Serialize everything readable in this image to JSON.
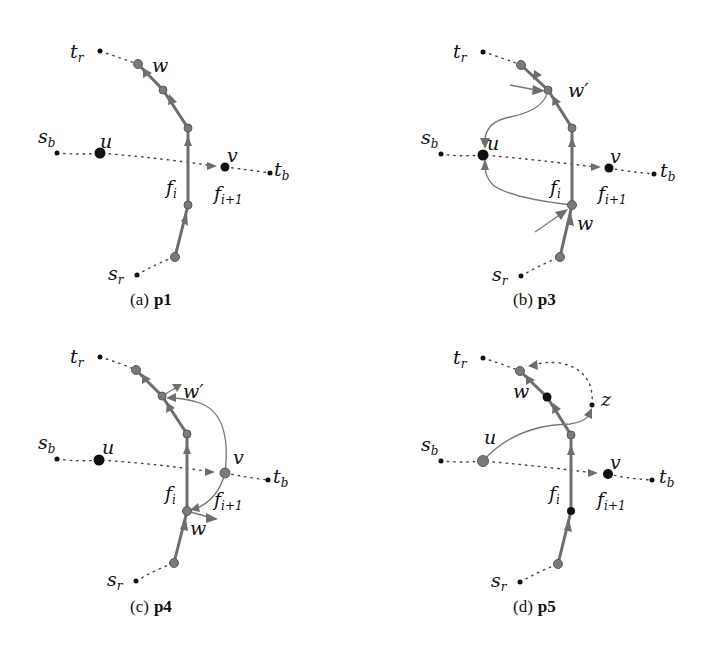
{
  "figure": {
    "panels": [
      {
        "id": "a",
        "caption_prefix": "(a)",
        "caption_bold": "p1",
        "labels": {
          "tr": "t",
          "tr_sub": "r",
          "sb": "s",
          "sb_sub": "b",
          "u": "u",
          "v": "v",
          "tb": "t",
          "tb_sub": "b",
          "fi": "f",
          "fi_sub": "i",
          "fi1": "f",
          "fi1_sub": "i+1",
          "sr": "s",
          "sr_sub": "r",
          "w": "w"
        }
      },
      {
        "id": "b",
        "caption_prefix": "(b)",
        "caption_bold": "p3",
        "labels": {
          "tr": "t",
          "tr_sub": "r",
          "sb": "s",
          "sb_sub": "b",
          "u": "u",
          "v": "v",
          "tb": "t",
          "tb_sub": "b",
          "fi": "f",
          "fi_sub": "i",
          "fi1": "f",
          "fi1_sub": "i+1",
          "sr": "s",
          "sr_sub": "r",
          "w": "w",
          "wp": "w′"
        }
      },
      {
        "id": "c",
        "caption_prefix": "(c)",
        "caption_bold": "p4",
        "labels": {
          "tr": "t",
          "tr_sub": "r",
          "sb": "s",
          "sb_sub": "b",
          "u": "u",
          "v": "v",
          "tb": "t",
          "tb_sub": "b",
          "fi": "f",
          "fi_sub": "i",
          "fi1": "f",
          "fi1_sub": "i+1",
          "sr": "s",
          "sr_sub": "r",
          "w": "w",
          "wp": "w′"
        }
      },
      {
        "id": "d",
        "caption_prefix": "(d)",
        "caption_bold": "p5",
        "labels": {
          "tr": "t",
          "tr_sub": "r",
          "sb": "s",
          "sb_sub": "b",
          "u": "u",
          "v": "v",
          "tb": "t",
          "tb_sub": "b",
          "fi": "f",
          "fi_sub": "i",
          "fi1": "f",
          "fi1_sub": "i+1",
          "sr": "s",
          "sr_sub": "r",
          "w": "w",
          "z": "z"
        }
      }
    ],
    "colors": {
      "red_path": "#6e6e6e",
      "black_node": "#111111",
      "gray_node": "#7a7a7a"
    }
  }
}
